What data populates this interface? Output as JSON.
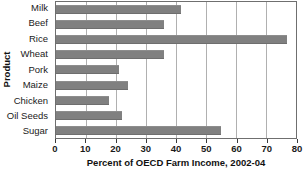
{
  "chart_data": {
    "type": "bar",
    "orientation": "horizontal",
    "title": "",
    "xlabel": "Percent of OECD Farm Income, 2002-04",
    "ylabel": "Product",
    "categories": [
      "Milk",
      "Beef",
      "Rice",
      "Wheat",
      "Pork",
      "Maize",
      "Chicken",
      "Oil Seeds",
      "Sugar"
    ],
    "values": [
      41.5,
      36,
      77,
      36,
      21,
      24,
      17.5,
      22,
      55
    ],
    "xlim": [
      0,
      80
    ],
    "xticks": [
      0,
      10,
      20,
      30,
      40,
      50,
      60,
      70,
      80
    ],
    "xtick_labels": [
      "0",
      "10",
      "20",
      "30",
      "40",
      "50",
      "60",
      "70",
      "80"
    ],
    "grid": "vertical",
    "legend": "none",
    "bar_color": "#808080",
    "plot_border_color": "#6f6f6f",
    "gridline_color": "#b0b0b0",
    "background": "#ffffff"
  }
}
